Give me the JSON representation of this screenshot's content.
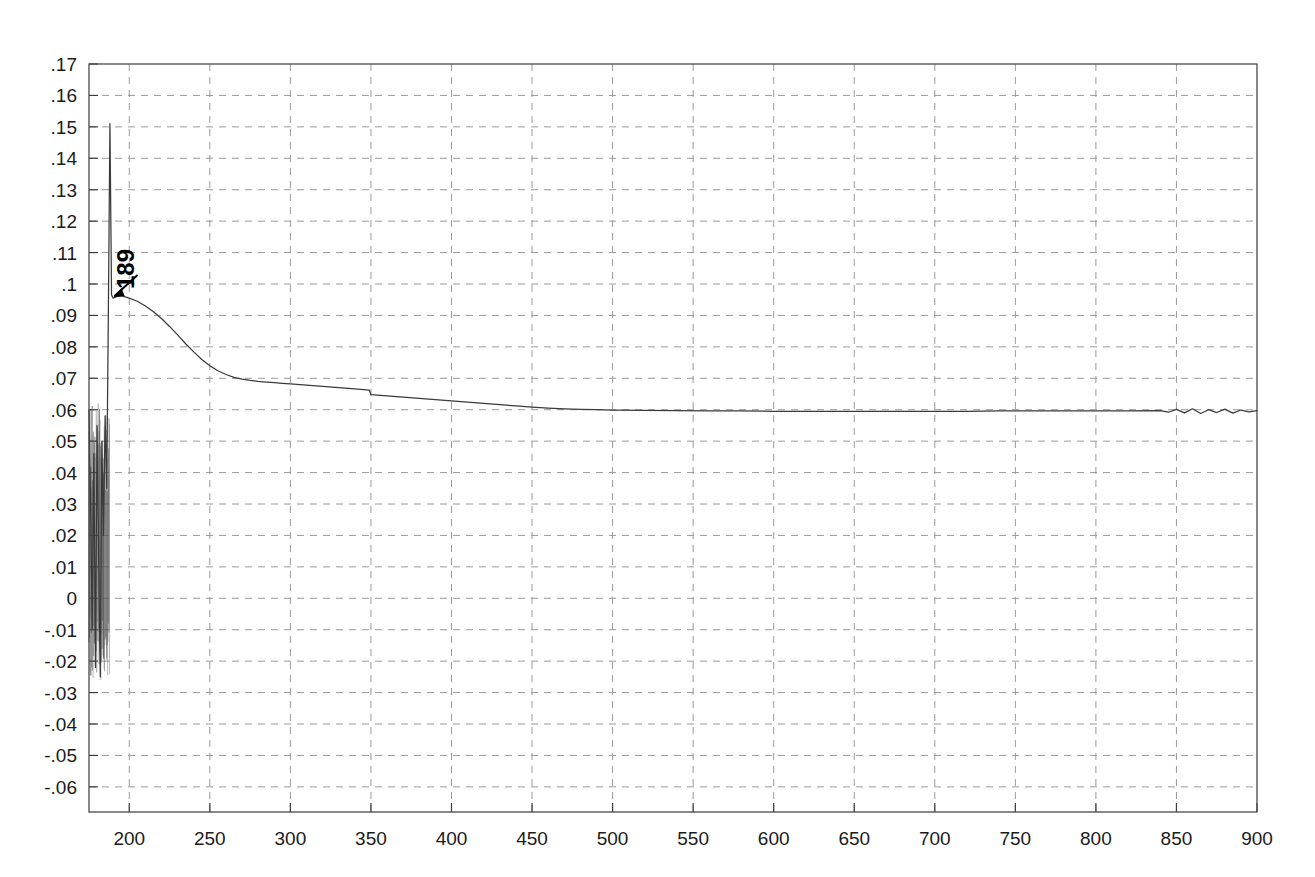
{
  "chart_data": {
    "type": "line",
    "title": "",
    "subtitle": "",
    "xlabel": "",
    "ylabel": "",
    "xlim": [
      175,
      900
    ],
    "ylim": [
      -0.068,
      0.17
    ],
    "grid": true,
    "legend": null,
    "x_ticks": [
      200,
      250,
      300,
      350,
      400,
      450,
      500,
      550,
      600,
      650,
      700,
      750,
      800,
      850,
      900
    ],
    "x_tick_labels": [
      "200",
      "250",
      "300",
      "350",
      "400",
      "450",
      "500",
      "550",
      "600",
      "650",
      "700",
      "750",
      "800",
      "850",
      "900"
    ],
    "y_ticks": [
      0.17,
      0.16,
      0.15,
      0.14,
      0.13,
      0.12,
      0.11,
      0.1,
      0.09,
      0.08,
      0.07,
      0.06,
      0.05,
      0.04,
      0.03,
      0.02,
      0.01,
      0,
      -0.01,
      -0.02,
      -0.03,
      -0.04,
      -0.05,
      -0.06
    ],
    "y_tick_labels": [
      ".17",
      ".16",
      ".15",
      ".14",
      ".13",
      ".12",
      ".11",
      ".1",
      ".09",
      ".08",
      ".07",
      ".06",
      ".05",
      ".04",
      ".03",
      ".02",
      ".01",
      "0",
      "-.01",
      "-.02",
      "-.03",
      "-.04",
      "-.05",
      "-.06"
    ],
    "annotations": [
      {
        "text": "189",
        "x": 189,
        "y": 0.0965,
        "rotation": -90,
        "arrow": true,
        "note": "arrow points to peak of decay onset"
      }
    ],
    "series": [
      {
        "name": "signal",
        "color": "#3a3a3a",
        "comment": "noisy baseline at left edge, sharp spike to 0.151 at x=188, exponential decay to plateau 0.060, small step down at x=350, noise after x=840",
        "x": [
          175,
          176,
          177,
          178,
          179,
          180,
          181,
          182,
          183,
          184,
          185,
          186,
          187,
          188,
          189,
          190,
          192,
          195,
          198,
          200,
          205,
          210,
          215,
          220,
          225,
          230,
          235,
          240,
          245,
          250,
          255,
          260,
          265,
          270,
          275,
          280,
          285,
          290,
          295,
          300,
          310,
          320,
          330,
          340,
          349,
          350,
          360,
          370,
          380,
          390,
          400,
          410,
          420,
          430,
          440,
          450,
          460,
          470,
          480,
          490,
          500,
          520,
          540,
          560,
          580,
          600,
          620,
          640,
          660,
          680,
          700,
          720,
          740,
          760,
          780,
          800,
          820,
          840,
          845,
          850,
          855,
          860,
          865,
          870,
          875,
          880,
          885,
          890,
          895,
          900
        ],
        "y": [
          0.06,
          0.03,
          -0.01,
          0.046,
          -0.022,
          0.055,
          0.012,
          -0.025,
          0.05,
          0.02,
          0.058,
          0.035,
          0.09,
          0.151,
          0.0965,
          0.0955,
          0.096,
          0.0962,
          0.0958,
          0.0955,
          0.0945,
          0.093,
          0.0912,
          0.089,
          0.0865,
          0.0838,
          0.081,
          0.0784,
          0.076,
          0.074,
          0.0724,
          0.0712,
          0.0703,
          0.0697,
          0.0693,
          0.069,
          0.0688,
          0.0686,
          0.0684,
          0.0682,
          0.0678,
          0.0674,
          0.067,
          0.0666,
          0.0662,
          0.0648,
          0.0644,
          0.064,
          0.0636,
          0.0632,
          0.0628,
          0.0624,
          0.062,
          0.0616,
          0.0612,
          0.0608,
          0.0605,
          0.0603,
          0.0601,
          0.06,
          0.0599,
          0.0598,
          0.0597,
          0.0596,
          0.0596,
          0.0595,
          0.0595,
          0.0595,
          0.0595,
          0.0595,
          0.0595,
          0.0595,
          0.0596,
          0.0596,
          0.0596,
          0.0596,
          0.0596,
          0.0597,
          0.0592,
          0.0601,
          0.059,
          0.0603,
          0.0588,
          0.06,
          0.0591,
          0.0602,
          0.0589,
          0.0599,
          0.0593,
          0.0597
        ]
      }
    ],
    "left_edge_noise": {
      "comment": "dense vertical oscillation band at left boundary before the spike",
      "x_range": [
        175,
        188
      ],
      "y_range": [
        -0.026,
        0.062
      ]
    }
  },
  "colors": {
    "background": "#ffffff",
    "line": "#3a3a3a",
    "grid": "#9a9a9a",
    "axis": "#4a4a4a",
    "text": "#1b1b1b"
  }
}
